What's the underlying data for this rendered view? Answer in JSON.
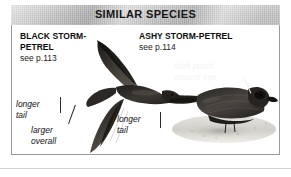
{
  "header": {
    "title": "SIMILAR SPECIES"
  },
  "species": [
    {
      "id": "black-storm-petrel",
      "name": "BLACK STORM-\nPETREL",
      "page_ref": "see p.113",
      "pose": "in flight",
      "callouts": [
        "longer\ntail",
        "larger\noverall"
      ]
    },
    {
      "id": "ashy-storm-petrel",
      "name": "ASHY STORM-PETREL",
      "page_ref": "see p.114",
      "pose": "perched",
      "callouts": [
        "dark patch\naround eye",
        "longer\ntail"
      ]
    }
  ],
  "callouts": {
    "longer_tail_black": "longer\ntail",
    "larger_overall": "larger\noverall",
    "longer_tail_ashy": "longer\ntail",
    "dark_patch": "dark patch\naround eye"
  },
  "colors": {
    "header_bg": "#c2c2c2",
    "header_text": "#171717",
    "panel_border": "#9a9a9a",
    "page_bg": "#ffffff",
    "label_text": "#0d0d0d",
    "callout_text": "#121212",
    "callout_text_light": "#f3f3f3",
    "bird_plumage": "#2b2927",
    "ground": "#d9d7d2"
  },
  "figure": {
    "type": "field-guide-comparison-plate",
    "caption_bar": "SIMILAR SPECIES",
    "subject_count": 2
  }
}
